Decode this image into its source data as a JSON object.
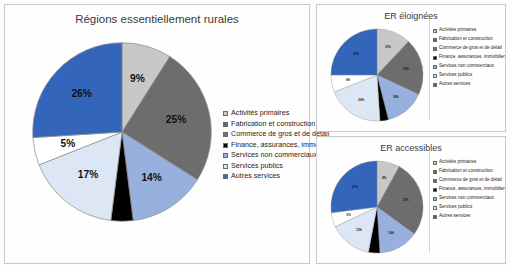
{
  "legend_labels": [
    "Activités primaires",
    "Fabrication et construction",
    "Commerce de gros et de détail",
    "Finance, assurances, immobilier",
    "Services non commerciaux",
    "Services publics",
    "Autres services"
  ],
  "colors": {
    "activites_primaires": "#c8c8c8",
    "fabrication_construction": "#656565",
    "commerce_gros_detail": "#6d6d6d",
    "finance_assurances": "#000000",
    "services_non_commerciaux": "#97b0de",
    "services_publics": "#dce6f5",
    "autres_services": "#3366bb",
    "white_slice": "#ffffff",
    "panel_border": "#c9c9c9",
    "title_text": "#3a3a3a"
  },
  "panels": {
    "main": {
      "title": "Régions essentiellement rurales"
    },
    "far": {
      "title": "ER éloignées"
    },
    "acc": {
      "title": "ER accessibles"
    }
  },
  "chart_data": [
    {
      "type": "pie",
      "title": "Régions essentiellement rurales",
      "legend_position": "right",
      "categories": [
        "Activités primaires",
        "Commerce de gros et de détail",
        "Services non commerciaux",
        "Finance, assurances, immobilier",
        "Services publics",
        "Fabrication et construction",
        "Autres services"
      ],
      "values": [
        9,
        25,
        14,
        4,
        17,
        5,
        26
      ],
      "labels": [
        "9%",
        "25%",
        "14%",
        "",
        "17%",
        "5%",
        "26%"
      ],
      "slice_colors": [
        "#c8c8c8",
        "#6d6d6d",
        "#97b0de",
        "#000000",
        "#dce6f5",
        "#ffffff",
        "#3366bb"
      ]
    },
    {
      "type": "pie",
      "title": "ER éloignées",
      "legend_position": "right",
      "categories": [
        "Activités primaires",
        "Commerce de gros et de détail",
        "Services non commerciaux",
        "Finance, assurances, immobilier",
        "Services publics",
        "Fabrication et construction",
        "Autres services"
      ],
      "values": [
        12,
        20,
        14,
        3,
        20,
        6,
        25
      ],
      "labels": [
        "12%",
        "20%",
        "14%",
        "3%",
        "20%",
        "6%",
        "25%"
      ],
      "slice_colors": [
        "#c8c8c8",
        "#6d6d6d",
        "#97b0de",
        "#000000",
        "#dce6f5",
        "#ffffff",
        "#3366bb"
      ]
    },
    {
      "type": "pie",
      "title": "ER accessibles",
      "legend_position": "right",
      "categories": [
        "Activités primaires",
        "Commerce de gros et de détail",
        "Services non commerciaux",
        "Finance, assurances, immobilier",
        "Services publics",
        "Fabrication et construction",
        "Autres services"
      ],
      "values": [
        8,
        27,
        14,
        4,
        15,
        5,
        27
      ],
      "labels": [
        "8%",
        "27%",
        "14%",
        "",
        "15%",
        "5%",
        "27%"
      ],
      "slice_colors": [
        "#c8c8c8",
        "#6d6d6d",
        "#97b0de",
        "#000000",
        "#dce6f5",
        "#ffffff",
        "#3366bb"
      ]
    }
  ]
}
